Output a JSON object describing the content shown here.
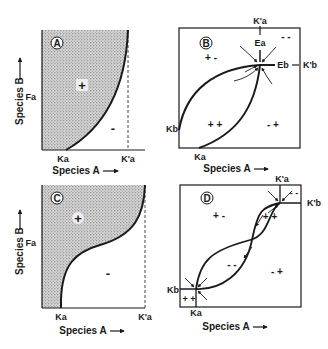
{
  "figure": {
    "panels": [
      {
        "id": "A",
        "badge": "A",
        "ylabel": "Species B",
        "xlabel": "Species A",
        "y_tick": "Fa",
        "x_ticks": [
          "Ka",
          "K'a"
        ],
        "regions": [
          {
            "sign": "+",
            "shaded": true
          },
          {
            "sign": "-",
            "shaded": false
          }
        ]
      },
      {
        "id": "B",
        "badge": "B",
        "xlabel": "Species A",
        "top_tick": "K'a",
        "labels": [
          "Ea",
          "Eb",
          "K'b",
          "Kb",
          "Ka"
        ],
        "regions": [
          "+ -",
          "- -",
          "+ +",
          "- +"
        ]
      },
      {
        "id": "C",
        "badge": "C",
        "ylabel": "Species B",
        "xlabel": "Species A",
        "y_tick": "Fa",
        "x_ticks": [
          "Ka",
          "K'a"
        ],
        "regions": [
          {
            "sign": "+",
            "shaded": true
          },
          {
            "sign": "-",
            "shaded": false
          }
        ]
      },
      {
        "id": "D",
        "badge": "D",
        "xlabel": "Species A",
        "top_tick": "K'a",
        "labels": [
          "K'b",
          "Kb",
          "Ka"
        ],
        "regions": [
          "+ -",
          "- -",
          "+ +",
          "- -",
          "- +",
          "+ +"
        ]
      }
    ]
  }
}
